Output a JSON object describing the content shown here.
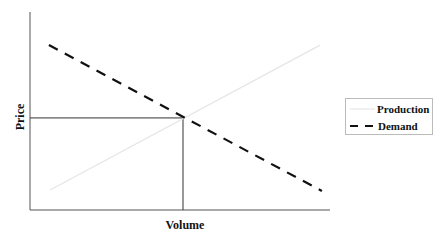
{
  "chart_data": {
    "type": "line",
    "title": "",
    "xlabel": "Volume",
    "ylabel": "Price",
    "xlim": [
      0,
      10
    ],
    "ylim": [
      0,
      10
    ],
    "grid": false,
    "ticks": false,
    "legend_position": "right",
    "series": [
      {
        "name": "Production",
        "style": "solid",
        "color": "#e6e6e6",
        "points": [
          [
            0.67,
            1.01
          ],
          [
            9.67,
            8.33
          ]
        ]
      },
      {
        "name": "Demand",
        "style": "dashed",
        "color": "#111111",
        "points": [
          [
            0.63,
            8.33
          ],
          [
            9.73,
            0.96
          ]
        ]
      }
    ],
    "equilibrium": {
      "x": 5.1,
      "y": 4.65,
      "guides": [
        "horizontal-to-y-axis",
        "vertical-to-x-axis"
      ]
    },
    "legend": [
      {
        "label": "Production",
        "style": "solid"
      },
      {
        "label": "Demand",
        "style": "dashed"
      }
    ]
  }
}
